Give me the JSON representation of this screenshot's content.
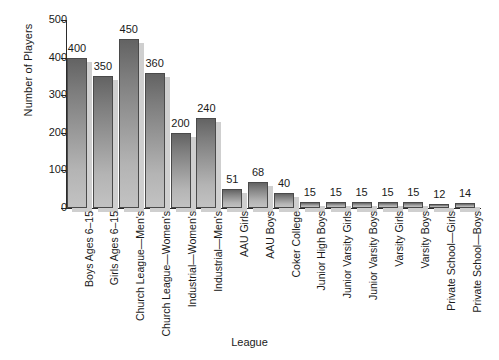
{
  "chart_data": {
    "type": "bar",
    "title": "",
    "xlabel": "League",
    "ylabel": "Number of Players",
    "ylim": [
      0,
      500
    ],
    "yticks": [
      0,
      100,
      200,
      300,
      400,
      500
    ],
    "grid": false,
    "legend": null,
    "value_labels_shown": true,
    "categories": [
      "Boys Ages 6–15",
      "Girls Ages 6–15",
      "Church League—Men's",
      "Church League—Women's",
      "Industrial—Women's",
      "Industrial—Men's",
      "AAU Girls",
      "AAU Boys",
      "Coker College",
      "Junior High Boys",
      "Junior Varsity Girls",
      "Junior Varsity Boys",
      "Varsity Girls",
      "Varsity Boys",
      "Private School—Girls",
      "Private School—Boys"
    ],
    "values": [
      400,
      350,
      450,
      360,
      200,
      240,
      51,
      68,
      40,
      15,
      15,
      15,
      15,
      15,
      12,
      14
    ],
    "value_label_text": [
      "400",
      "350",
      "450",
      "360",
      "200",
      "240",
      "51",
      "68",
      "40",
      "15",
      "15",
      "15",
      "15",
      "15",
      "12",
      "14"
    ],
    "ytick_labels": [
      "0",
      "100",
      "200",
      "300",
      "400",
      "500"
    ],
    "colors": {
      "bar_top": "#636363",
      "bar_bottom": "#c2c2c2",
      "bar_outline": "#4a4a4a",
      "bar_shadow": "#cfcfcf",
      "axis": "#2b2b2b",
      "text": "#1a1a1a",
      "background": "#ffffff"
    }
  }
}
